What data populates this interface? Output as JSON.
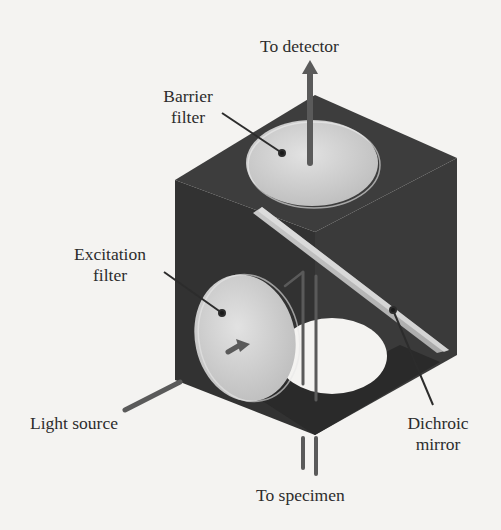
{
  "figure": {
    "labels": {
      "to_detector": "To detector",
      "barrier_filter_line1": "Barrier",
      "barrier_filter_line2": "filter",
      "excitation_filter_line1": "Excitation",
      "excitation_filter_line2": "filter",
      "light_source": "Light source",
      "dichroic_mirror_line1": "Dichroic",
      "dichroic_mirror_line2": "mirror",
      "to_specimen": "To specimen"
    },
    "colors": {
      "background": "#f4f3f1",
      "cube_dark": "#3a3a3a",
      "cube_side": "#2e2e2e",
      "filter_light": "#cfcfcf",
      "beam": "#5a5a5a",
      "label_text": "#2c2c2c"
    }
  }
}
